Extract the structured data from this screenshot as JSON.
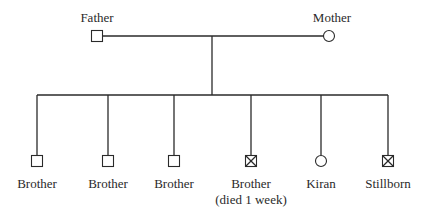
{
  "diagram": {
    "type": "pedigree",
    "parents": {
      "father": {
        "label": "Father",
        "symbol": "square",
        "sex": "male",
        "deceased": false
      },
      "mother": {
        "label": "Mother",
        "symbol": "circle",
        "sex": "female",
        "deceased": false
      }
    },
    "children": [
      {
        "label": "Brother",
        "sublabel": "",
        "symbol": "square",
        "sex": "male",
        "deceased": false
      },
      {
        "label": "Brother",
        "sublabel": "",
        "symbol": "square",
        "sex": "male",
        "deceased": false
      },
      {
        "label": "Brother",
        "sublabel": "",
        "symbol": "square",
        "sex": "male",
        "deceased": false
      },
      {
        "label": "Brother",
        "sublabel": "(died 1 week)",
        "symbol": "square-crossed",
        "sex": "male",
        "deceased": true
      },
      {
        "label": "Kiran",
        "sublabel": "",
        "symbol": "circle",
        "sex": "female",
        "deceased": false
      },
      {
        "label": "Stillborn",
        "sublabel": "",
        "symbol": "square-crossed",
        "sex": "male",
        "deceased": true
      }
    ],
    "colors": {
      "line": "#2a2a2a",
      "background": "#ffffff"
    }
  }
}
